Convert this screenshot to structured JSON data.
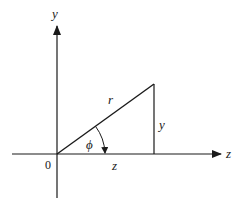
{
  "diagram": {
    "type": "polar-coordinates-triangle",
    "colors": {
      "stroke": "#1a1a1a",
      "background": "#ffffff"
    },
    "axes": {
      "vertical_label": "y",
      "horizontal_label": "z",
      "origin_label": "0"
    },
    "triangle": {
      "hypotenuse_label": "r",
      "opposite_label": "y",
      "adjacent_label": "z",
      "angle_label": "ϕ"
    }
  }
}
